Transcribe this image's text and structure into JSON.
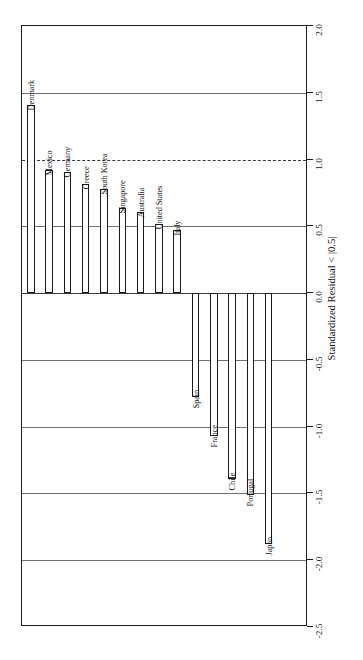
{
  "chart_data": {
    "type": "bar",
    "title": "",
    "subtitle": "",
    "xlabel": "",
    "ylabel": "Standardized Residual < |0.5|",
    "orientation": "vertical-bars-rotated-canvas",
    "grid": true,
    "legend": "none",
    "ylim": [
      -2.5,
      2.0
    ],
    "ytick_labels": [
      "2.0",
      "1.5",
      "1.0",
      "0.5",
      "0.0",
      "-0.5",
      "-1.0",
      "-1.5",
      "-2.0",
      "-2.5"
    ],
    "ytick_values": [
      2.0,
      1.5,
      1.0,
      0.5,
      0.0,
      -0.5,
      -1.0,
      -1.5,
      -2.0,
      -2.5
    ],
    "reference_line": 1.0,
    "categories": [
      "Denmark",
      "Mexico",
      "Germany",
      "Greece",
      "South Korea",
      "Singapore",
      "Australia",
      "United States",
      "Italy",
      "Spain",
      "France",
      "Chile",
      "Portugal",
      "Japan"
    ],
    "values": [
      1.41,
      0.92,
      0.91,
      0.82,
      0.78,
      0.64,
      0.61,
      0.52,
      0.47,
      -0.78,
      -1.07,
      -1.39,
      -1.51,
      -1.88
    ],
    "bar_face_color": "#ffffff",
    "bar_edge_color": "#1a1a1a",
    "axis_color": "#1a1a1a",
    "grid_color": "#6f6f6f"
  }
}
